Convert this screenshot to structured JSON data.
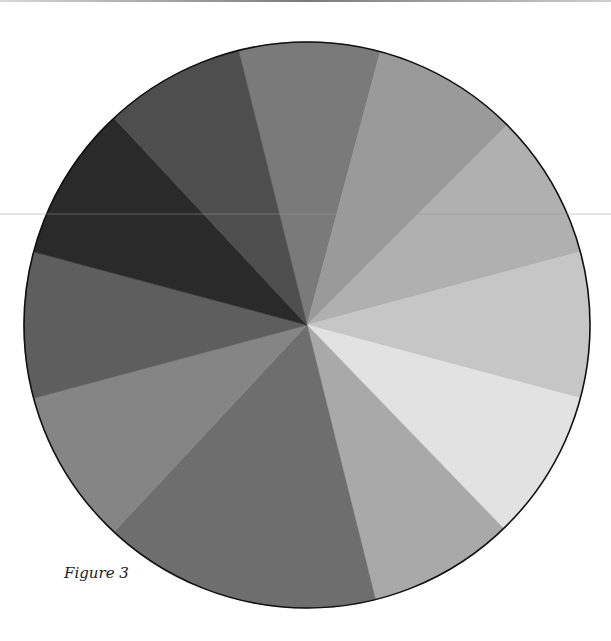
{
  "figure": {
    "caption": "Figure 3"
  },
  "chart_data": {
    "type": "pie",
    "title": "",
    "caption": "Figure 3",
    "legend": "none",
    "labels_shown": false,
    "center": [
      307,
      325
    ],
    "radius": 283,
    "start_angle_deg": -14,
    "direction": "clockwise",
    "slices": [
      {
        "index": 1,
        "degrees": 29,
        "percent": 8.1,
        "color": "#7a7a7a"
      },
      {
        "index": 2,
        "degrees": 30,
        "percent": 8.3,
        "color": "#9a9a9a"
      },
      {
        "index": 3,
        "degrees": 30,
        "percent": 8.3,
        "color": "#b0b0b0"
      },
      {
        "index": 4,
        "degrees": 30,
        "percent": 8.3,
        "color": "#c6c6c6"
      },
      {
        "index": 5,
        "degrees": 31,
        "percent": 8.6,
        "color": "#e2e2e2"
      },
      {
        "index": 6,
        "degrees": 30,
        "percent": 8.3,
        "color": "#a9a9a9"
      },
      {
        "index": 7,
        "degrees": 57,
        "percent": 15.8,
        "color": "#6e6e6e"
      },
      {
        "index": 8,
        "degrees": 32,
        "percent": 8.9,
        "color": "#858585"
      },
      {
        "index": 9,
        "degrees": 30,
        "percent": 8.3,
        "color": "#5e5e5e"
      },
      {
        "index": 10,
        "degrees": 32,
        "percent": 8.9,
        "color": "#2a2a2a"
      },
      {
        "index": 11,
        "degrees": 29,
        "percent": 8.1,
        "color": "#4e4e4e"
      }
    ],
    "outline_color": "#111111"
  }
}
